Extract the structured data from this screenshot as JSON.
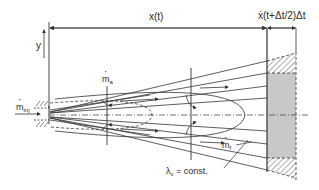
{
  "diagram": {
    "type": "spray-penetration-schematic",
    "labels": {
      "x_t": "x(t)",
      "increment": "ẋ(t+Δt/2)Δt",
      "y_axis": "y",
      "m_inj_base": "m",
      "m_inj_sub": "inj",
      "m_a_base": "m",
      "m_a_sub": "a",
      "m_f_base": "m",
      "m_f_sub": "f",
      "lambda_base": "λ",
      "lambda_sub": "v",
      "lambda_rest": " = const."
    },
    "colors": {
      "line": "#333333",
      "shaded_region": "#c8c8c8",
      "background": "#ffffff"
    }
  }
}
